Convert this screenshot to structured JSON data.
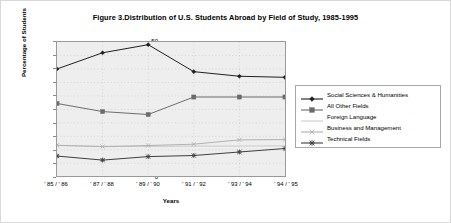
{
  "figure": {
    "title": "Figure 3.Distribution of U.S. Students Abroad by Field of Study, 1985-1995",
    "border_color": "#d9d9d9",
    "plot_background": "#eeeeee"
  },
  "chart_data": {
    "type": "line",
    "title": "Figure 3.Distribution of U.S. Students Abroad by Field of Study, 1985-1995",
    "xlabel": "Years",
    "ylabel": "Percentage of Students",
    "categories": [
      "' 85 / ' 86",
      "' 87 / ' 88",
      "' 89 / ' 90",
      "' 91 / ' 92",
      "' 93 / ' 94",
      "' 94 / ' 95"
    ],
    "ylim": [
      0,
      50
    ],
    "yticks": [
      0,
      5,
      10,
      15,
      20,
      25,
      30,
      35,
      40,
      45,
      50
    ],
    "grid": true,
    "legend_position": "right",
    "series": [
      {
        "name": "Social Sciences & Humanities",
        "marker": "diamond",
        "color": "#1d1d1d",
        "values": [
          40.0,
          46.0,
          49.0,
          39.0,
          37.3,
          36.9
        ]
      },
      {
        "name": "All Other Fields",
        "marker": "square",
        "color": "#6b6b6b",
        "values": [
          27.2,
          24.2,
          23.1,
          29.6,
          29.6,
          29.6
        ]
      },
      {
        "name": "Foreign Language",
        "marker": "none",
        "color": "#c4c4c4",
        "values": [
          11.6,
          11.3,
          11.3,
          11.4,
          11.4,
          11.5
        ]
      },
      {
        "name": "Business and Management",
        "marker": "x",
        "color": "#b0b0b0",
        "values": [
          11.7,
          11.2,
          11.6,
          12.1,
          13.7,
          13.8
        ]
      },
      {
        "name": "Technical Fields",
        "marker": "asterisk",
        "color": "#3d3d3d",
        "values": [
          7.7,
          6.2,
          7.5,
          7.9,
          9.2,
          10.5
        ]
      }
    ]
  }
}
